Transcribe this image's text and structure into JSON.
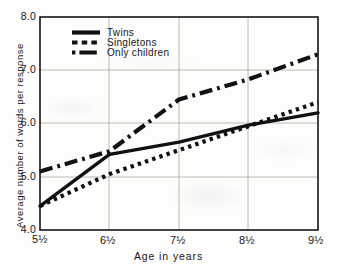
{
  "chart_data": {
    "type": "line",
    "title": "",
    "xlabel": "Age in years",
    "ylabel": "Average number of words per response",
    "x": [
      5.5,
      6.5,
      7.5,
      8.5,
      9.5
    ],
    "xtick_labels": [
      "5½",
      "6½",
      "7½",
      "8½",
      "9½"
    ],
    "ytick_labels": [
      "4.0",
      "5.0",
      "6.0",
      "7.0",
      "8.0"
    ],
    "ytick_values": [
      4.0,
      5.0,
      6.0,
      7.0,
      8.0
    ],
    "xlim": [
      5.5,
      9.5
    ],
    "ylim": [
      4.0,
      8.0
    ],
    "grid": true,
    "legend_position": "top-center",
    "series": [
      {
        "name": "Twins",
        "style": "solid",
        "color": "#111111",
        "values": [
          4.45,
          5.42,
          5.65,
          5.97,
          6.2
        ]
      },
      {
        "name": "Singletons",
        "style": "dotted",
        "color": "#111111",
        "values": [
          4.45,
          5.05,
          5.5,
          5.95,
          6.4
        ]
      },
      {
        "name": "Only children",
        "style": "dashdot",
        "color": "#111111",
        "values": [
          5.1,
          5.48,
          6.45,
          6.83,
          7.3
        ]
      }
    ]
  },
  "legend": {
    "items": [
      {
        "label": "Twins",
        "swatch": "solid-line-swatch"
      },
      {
        "label": "Singletons",
        "swatch": "dotted-line-swatch"
      },
      {
        "label": "Only children",
        "swatch": "dashdot-line-swatch"
      }
    ]
  },
  "axes": {
    "y_ticks": [
      "8.0",
      "7.0",
      "6.0",
      "5.0",
      "4.0"
    ],
    "x_ticks": [
      "5½",
      "6½",
      "7½",
      "8½",
      "9½"
    ],
    "x_title": "Age in years",
    "y_title": "Average number of words per response"
  }
}
